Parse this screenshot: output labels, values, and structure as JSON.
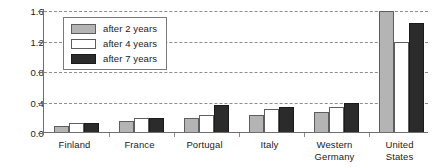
{
  "chart_data": {
    "type": "bar",
    "title": "",
    "xlabel": "",
    "ylabel": "",
    "ylim": [
      0.0,
      1.6
    ],
    "yticks": [
      "0.0",
      "0.4",
      "0.8",
      "1.2",
      "1.6"
    ],
    "ytick_values": [
      0.0,
      0.4,
      0.8,
      1.2,
      1.6
    ],
    "grid": true,
    "legend_position": "upper-left-inside",
    "categories": [
      "Finland",
      "France",
      "Portugal",
      "Italy",
      "Western Germany",
      "United States"
    ],
    "series": [
      {
        "name": "after 2 years",
        "color": "#b4b4b4",
        "values": [
          0.09,
          0.16,
          0.2,
          0.24,
          0.28,
          1.6
        ]
      },
      {
        "name": "after 4 years",
        "color": "#ffffff",
        "values": [
          0.13,
          0.2,
          0.24,
          0.31,
          0.34,
          1.19
        ]
      },
      {
        "name": "after 7 years",
        "color": "#2b2b2b",
        "values": [
          0.13,
          0.2,
          0.37,
          0.34,
          0.4,
          1.44
        ]
      }
    ]
  },
  "legend": {
    "items": [
      {
        "label": "after 2 years",
        "swatch": "legend-swatch-gray"
      },
      {
        "label": "after 4 years",
        "swatch": "legend-swatch-white"
      },
      {
        "label": "after 7 years",
        "swatch": "legend-swatch-black"
      }
    ]
  },
  "axis": {
    "y_labels": [
      "1.6",
      "1.2",
      "0.8",
      "0.4",
      "0.0"
    ],
    "x_labels": [
      {
        "line1": "Finland",
        "line2": ""
      },
      {
        "line1": "France",
        "line2": ""
      },
      {
        "line1": "Portugal",
        "line2": ""
      },
      {
        "line1": "Italy",
        "line2": ""
      },
      {
        "line1": "Western",
        "line2": "Germany"
      },
      {
        "line1": "United",
        "line2": "States"
      }
    ]
  }
}
